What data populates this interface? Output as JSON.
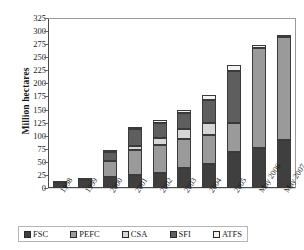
{
  "chart_data": {
    "type": "bar",
    "stacked": true,
    "title": "",
    "xlabel": "",
    "ylabel": "Million hectares",
    "ylim": [
      0,
      325
    ],
    "ytick_step": 25,
    "yticks": [
      325,
      300,
      275,
      250,
      225,
      200,
      175,
      150,
      125,
      100,
      75,
      50,
      25,
      0
    ],
    "grid": true,
    "legend_position": "bottom",
    "categories": [
      "1998",
      "1999",
      "2000",
      "2001",
      "2002",
      "2003",
      "2004",
      "2005",
      "May 2006",
      "May 2007"
    ],
    "series": [
      {
        "name": "FSC",
        "color": "#3f3f3f",
        "values": [
          10,
          16,
          21,
          24,
          29,
          38,
          45,
          68,
          77,
          92
        ]
      },
      {
        "name": "PEFC",
        "color": "#9a9a9a",
        "values": [
          0,
          0,
          30,
          49,
          53,
          55,
          57,
          56,
          191,
          196
        ]
      },
      {
        "name": "CSA",
        "color": "#d6d6d6",
        "values": [
          0,
          0,
          0,
          8,
          13,
          20,
          22,
          0,
          0,
          0
        ]
      },
      {
        "name": "SFI",
        "color": "#5e5e5e",
        "values": [
          3,
          4,
          18,
          31,
          30,
          30,
          45,
          100,
          0,
          0
        ]
      },
      {
        "name": "ATFS",
        "color": "#f2f2f2",
        "values": [
          0,
          0,
          4,
          5,
          5,
          7,
          9,
          11,
          5,
          5
        ]
      }
    ],
    "totals": [
      13,
      20,
      73,
      117,
      130,
      150,
      178,
      235,
      273,
      293
    ]
  },
  "legend": {
    "items": [
      {
        "label": "FSC",
        "swatch": "#3f3f3f"
      },
      {
        "label": "PEFC",
        "swatch": "#9a9a9a"
      },
      {
        "label": "CSA",
        "swatch": "#d6d6d6"
      },
      {
        "label": "SFI",
        "swatch": "#5e5e5e"
      },
      {
        "label": "ATFS",
        "swatch": "#f2f2f2"
      }
    ]
  }
}
